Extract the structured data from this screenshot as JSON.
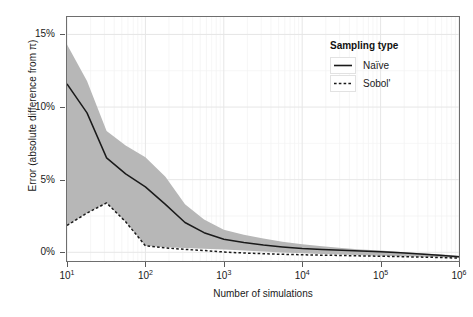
{
  "chart_data": {
    "type": "line",
    "title": "",
    "xlabel": "Number of simulations",
    "ylabel": "Error (absolute difference from π)",
    "x_scale": "log10",
    "xlim": [
      10,
      1000000
    ],
    "ylim": [
      -0.6,
      16.2
    ],
    "grid": true,
    "legend_position": "top-right-inside",
    "y_ticks": [
      {
        "value": 0,
        "label": "0%"
      },
      {
        "value": 5,
        "label": "5%"
      },
      {
        "value": 10,
        "label": "10%"
      },
      {
        "value": 15,
        "label": "15%"
      }
    ],
    "x_ticks": [
      {
        "value": 10,
        "base": "10",
        "exp": "1"
      },
      {
        "value": 100,
        "base": "10",
        "exp": "2"
      },
      {
        "value": 1000,
        "base": "10",
        "exp": "3"
      },
      {
        "value": 10000,
        "base": "10",
        "exp": "4"
      },
      {
        "value": 100000,
        "base": "10",
        "exp": "5"
      },
      {
        "value": 1000000,
        "base": "10",
        "exp": "6"
      }
    ],
    "x": [
      10,
      18,
      32,
      56,
      100,
      180,
      320,
      560,
      1000,
      1800,
      3200,
      5600,
      10000,
      18000,
      32000,
      56000,
      100000,
      180000,
      320000,
      560000,
      1000000
    ],
    "series": [
      {
        "name": "Naïve",
        "style": "solid",
        "color": "#1a1a1a",
        "values": [
          11.6,
          9.6,
          6.5,
          5.4,
          4.5,
          3.3,
          2.05,
          1.35,
          0.9,
          0.68,
          0.5,
          0.37,
          0.26,
          0.2,
          0.14,
          0.08,
          0.03,
          -0.04,
          -0.12,
          -0.2,
          -0.3
        ]
      },
      {
        "name": "Sobol'",
        "style": "dashed",
        "color": "#1a1a1a",
        "values": [
          1.85,
          2.7,
          3.4,
          2.1,
          0.45,
          0.3,
          0.2,
          0.12,
          0.02,
          -0.05,
          -0.1,
          -0.14,
          -0.17,
          -0.2,
          -0.22,
          -0.25,
          -0.27,
          -0.3,
          -0.33,
          -0.36,
          -0.4
        ]
      }
    ],
    "ribbon": {
      "name": "Naïve range",
      "fill": "#b7b7b7",
      "upper": [
        14.3,
        11.8,
        8.35,
        7.35,
        6.55,
        5.2,
        3.3,
        2.25,
        1.55,
        1.2,
        0.95,
        0.72,
        0.55,
        0.42,
        0.3,
        0.2,
        0.12,
        0.02,
        -0.06,
        -0.14,
        -0.24
      ],
      "lower": [
        1.85,
        2.7,
        3.4,
        2.1,
        0.45,
        0.35,
        0.3,
        0.25,
        0.2,
        0.12,
        0.05,
        -0.02,
        -0.07,
        -0.12,
        -0.16,
        -0.2,
        -0.23,
        -0.27,
        -0.3,
        -0.34,
        -0.38
      ]
    }
  },
  "legend": {
    "title": "Sampling type",
    "entries": [
      {
        "label": "Naïve",
        "style": "solid"
      },
      {
        "label": "Sobol'",
        "style": "dashed"
      }
    ]
  },
  "colors": {
    "line": "#1a1a1a",
    "ribbon": "#b7b7b7",
    "grid_major": "#e6e6e6",
    "grid_minor": "#f2f2f2",
    "panel_border": "#6e6e6e",
    "axis_text": "#1a1a1a"
  }
}
